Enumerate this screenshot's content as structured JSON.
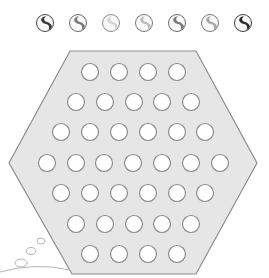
{
  "puzzle": {
    "marble_legend": {
      "marbles": [
        {
          "shade": "dark",
          "swirl_color": "#3a3a3a",
          "ring_color": "#4a4a4a",
          "cx": 45
        },
        {
          "shade": "medium",
          "swirl_color": "#7a7a7a",
          "ring_color": "#6a6a6a",
          "cx": 78
        },
        {
          "shade": "very-light",
          "swirl_color": "#d4d4d4",
          "ring_color": "#8a8a8a",
          "cx": 111
        },
        {
          "shade": "light",
          "swirl_color": "#bdbdbd",
          "ring_color": "#7a7a7a",
          "cx": 144
        },
        {
          "shade": "medium",
          "swirl_color": "#7a7a7a",
          "ring_color": "#6a6a6a",
          "cx": 177
        },
        {
          "shade": "light",
          "swirl_color": "#a8a8a8",
          "ring_color": "#7a7a7a",
          "cx": 210
        },
        {
          "shade": "dark",
          "swirl_color": "#2e2e2e",
          "ring_color": "#3e3e3e",
          "cx": 243
        }
      ],
      "cy": 23
    },
    "board": {
      "shape": "hexagon",
      "fill_color": "#e6e6e6",
      "stroke_color": "#8c8c8c",
      "vertices": [
        [
          70,
          51
        ],
        [
          196,
          51
        ],
        [
          257,
          163
        ],
        [
          196,
          274
        ],
        [
          72,
          274
        ],
        [
          9,
          163
        ]
      ],
      "hole_radius": 8.5,
      "hole_fill": "#ffffff",
      "hole_stroke": "#8a8a8a",
      "rows": [
        {
          "y": 72,
          "xs": [
            90,
            119,
            148,
            177
          ]
        },
        {
          "y": 102,
          "xs": [
            76,
            105,
            134,
            162,
            191
          ]
        },
        {
          "y": 132,
          "xs": [
            61,
            90,
            119,
            148,
            177,
            205
          ]
        },
        {
          "y": 163,
          "xs": [
            47,
            76,
            104,
            133,
            162,
            191,
            220
          ]
        },
        {
          "y": 193,
          "xs": [
            61,
            90,
            119,
            148,
            177,
            205
          ]
        },
        {
          "y": 224,
          "xs": [
            76,
            105,
            134,
            162,
            191
          ]
        },
        {
          "y": 254,
          "xs": [
            90,
            119,
            148,
            177
          ]
        }
      ],
      "hole_count": 37
    },
    "decoration": {
      "bubbles": [
        {
          "cx": 41,
          "cy": 241,
          "rx": 4,
          "ry": 3
        },
        {
          "cx": 31,
          "cy": 251,
          "rx": 5,
          "ry": 3.5
        },
        {
          "cx": 21,
          "cy": 263,
          "rx": 6,
          "ry": 4
        }
      ],
      "curve_color": "#b5b5b5"
    }
  }
}
